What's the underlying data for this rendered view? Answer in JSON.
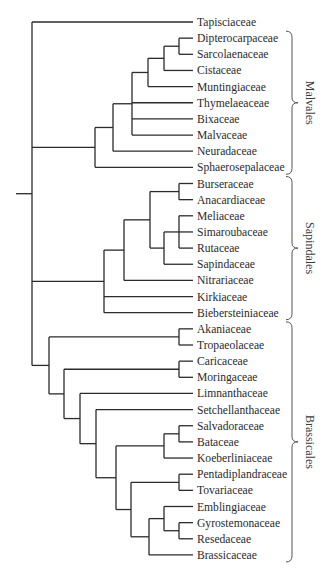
{
  "diagram": {
    "type": "phylogenetic-tree",
    "row_spacing": 16.15,
    "first_row_y": 22,
    "leaf_x": 193,
    "label_x": 197,
    "root": {
      "stub_x1": 16,
      "x": 32
    },
    "taxa": [
      "Tapisciaceae",
      "Dipterocarpaceae",
      "Sarcolaenaceae",
      "Cistaceae",
      "Muntingiaceae",
      "Thymelaeaceae",
      "Bixaceae",
      "Malvaceae",
      "Neuradaceae",
      "Sphaerosepalaceae",
      "Burseraceae",
      "Anacardiaceae",
      "Meliaceae",
      "Simaroubaceae",
      "Rutaceae",
      "Sapindaceae",
      "Nitrariaceae",
      "Kirkiaceae",
      "Biebersteiniaceae",
      "Akaniaceae",
      "Tropaeolaceae",
      "Caricaceae",
      "Moringaceae",
      "Limnanthaceae",
      "Setchellanthaceae",
      "Salvadoraceae",
      "Bataceae",
      "Koeberliniaceae",
      "Pentadiplandraceae",
      "Tovariaceae",
      "Emblingiaceae",
      "Gyrostemonaceae",
      "Resedaceae",
      "Brassicaceae"
    ],
    "tree": {
      "x": 32,
      "children": [
        {
          "leaf": 0
        },
        {
          "x": 95,
          "children": [
            {
              "x": 113,
              "children": [
                {
                  "x": 132,
                  "children": [
                    {
                      "x": 148,
                      "children": [
                        {
                          "x": 164,
                          "children": [
                            {
                              "x": 179,
                              "children": [
                                {
                                  "leaf": 1
                                },
                                {
                                  "leaf": 2
                                }
                              ]
                            },
                            {
                              "leaf": 3
                            }
                          ]
                        },
                        {
                          "leaf": 4
                        }
                      ]
                    },
                    {
                      "leaf": 5
                    },
                    {
                      "leaf": 6
                    },
                    {
                      "leaf": 7
                    }
                  ]
                },
                {
                  "leaf": 8
                }
              ]
            },
            {
              "leaf": 9
            }
          ]
        },
        {
          "x": 104,
          "children": [
            {
              "x": 124,
              "children": [
                {
                  "x": 150,
                  "children": [
                    {
                      "x": 179,
                      "children": [
                        {
                          "leaf": 10
                        },
                        {
                          "leaf": 11
                        }
                      ]
                    },
                    {
                      "x": 164,
                      "children": [
                        {
                          "x": 179,
                          "children": [
                            {
                              "leaf": 12
                            },
                            {
                              "leaf": 13
                            },
                            {
                              "leaf": 14
                            }
                          ]
                        },
                        {
                          "leaf": 15
                        }
                      ]
                    }
                  ]
                },
                {
                  "leaf": 16
                }
              ]
            },
            {
              "leaf": 17
            },
            {
              "leaf": 18
            }
          ]
        },
        {
          "x": 49,
          "children": [
            {
              "x": 179,
              "children": [
                {
                  "leaf": 19
                },
                {
                  "leaf": 20
                }
              ]
            },
            {
              "x": 64,
              "children": [
                {
                  "x": 179,
                  "children": [
                    {
                      "leaf": 21
                    },
                    {
                      "leaf": 22
                    }
                  ]
                },
                {
                  "x": 80,
                  "children": [
                    {
                      "leaf": 23
                    },
                    {
                      "x": 96,
                      "children": [
                        {
                          "leaf": 24
                        },
                        {
                          "x": 116,
                          "children": [
                            {
                              "x": 164,
                              "children": [
                                {
                                  "x": 179,
                                  "children": [
                                    {
                                      "leaf": 25
                                    },
                                    {
                                      "leaf": 26
                                    }
                                  ]
                                },
                                {
                                  "leaf": 27
                                }
                              ]
                            },
                            {
                              "x": 131,
                              "children": [
                                {
                                  "x": 179,
                                  "children": [
                                    {
                                      "leaf": 28
                                    },
                                    {
                                      "leaf": 29
                                    }
                                  ]
                                },
                                {
                                  "x": 149,
                                  "children": [
                                    {
                                      "x": 164,
                                      "children": [
                                        {
                                          "leaf": 30
                                        },
                                        {
                                          "x": 179,
                                          "children": [
                                            {
                                              "leaf": 31
                                            },
                                            {
                                              "leaf": 32
                                            }
                                          ]
                                        }
                                      ]
                                    },
                                    {
                                      "leaf": 33
                                    }
                                  ]
                                }
                              ]
                            }
                          ]
                        }
                      ]
                    }
                  ]
                }
              ]
            }
          ]
        }
      ]
    },
    "orders": [
      {
        "name": "Malvales",
        "from": 1,
        "to": 9
      },
      {
        "name": "Sapindales",
        "from": 10,
        "to": 18
      },
      {
        "name": "Brassicales",
        "from": 19,
        "to": 33
      }
    ],
    "colors": {
      "branch": "#2b2b2b",
      "text": "#2a2a2a",
      "brace": "#555555"
    }
  }
}
